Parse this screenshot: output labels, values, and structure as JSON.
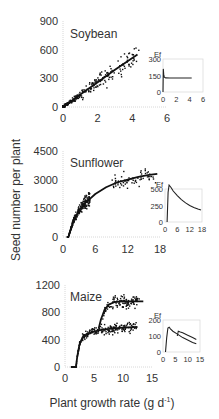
{
  "figure": {
    "ylabel": "Seed number per plant",
    "xlabel": "Plant growth rate (g d",
    "xlabel_sup": "-1",
    "xlabel_close": ")"
  },
  "chart_data": [
    {
      "type": "scatter",
      "title": "Soybean",
      "xlabel": "Plant growth rate (g d-1)",
      "ylabel": "Seed number per plant",
      "xlim": [
        0,
        6
      ],
      "ylim": [
        0,
        900
      ],
      "xticks": [
        0,
        2,
        4,
        6
      ],
      "yticks": [
        0,
        300,
        600,
        900
      ],
      "fit": {
        "type": "line",
        "x": [
          0,
          0.5,
          1,
          2,
          3,
          4.3
        ],
        "y": [
          0,
          65,
          130,
          260,
          390,
          550
        ]
      },
      "scatter_cloud": {
        "x_range": [
          0,
          4.5
        ],
        "y_range": [
          0,
          600
        ],
        "n": 260,
        "model": "linear",
        "slope": 128,
        "spread": 0.35
      },
      "inset": {
        "ylabel": "Ef",
        "xlim": [
          0,
          6
        ],
        "ylim": [
          0,
          300
        ],
        "xticks": [
          0,
          2,
          4,
          6
        ],
        "yticks": [
          0,
          150,
          300
        ],
        "series": [
          {
            "x": [
              0,
              0.05,
              0.1,
              0.2,
              0.4,
              1,
              2,
              3,
              4.3
            ],
            "y": [
              0,
              210,
              160,
              135,
              128,
              127,
              127,
              127,
              127
            ]
          }
        ]
      }
    },
    {
      "type": "scatter",
      "title": "Sunflower",
      "xlabel": "Plant growth rate (g d-1)",
      "ylabel": "Seed number per plant",
      "xlim": [
        0,
        18
      ],
      "ylim": [
        0,
        4500
      ],
      "xticks": [
        0,
        6,
        12,
        18
      ],
      "yticks": [
        0,
        1500,
        3000,
        4500
      ],
      "fit": {
        "type": "curve",
        "x": [
          1,
          2,
          3,
          4,
          5,
          6,
          8,
          10,
          12,
          14,
          16,
          17.5
        ],
        "y": [
          0,
          900,
          1400,
          1750,
          2000,
          2250,
          2600,
          2850,
          3000,
          3150,
          3250,
          3300
        ]
      },
      "scatter_cloud": {
        "x_range": [
          0.5,
          17.5
        ],
        "y_range": [
          0,
          4300
        ],
        "n": 280
      },
      "inset": {
        "ylabel": "Ef",
        "xlim": [
          0,
          18
        ],
        "ylim": [
          0,
          500
        ],
        "xticks": [
          0,
          6,
          12,
          18
        ],
        "yticks": [
          0,
          250,
          500
        ],
        "series": [
          {
            "x": [
              1,
              1.5,
              2,
              3,
              4,
              6,
              8,
              10,
              12,
              14,
              16,
              17.5
            ],
            "y": [
              0,
              450,
              560,
              520,
              470,
              400,
              340,
              290,
              250,
              220,
              195,
              180
            ]
          }
        ]
      }
    },
    {
      "type": "scatter",
      "title": "Maize",
      "xlabel": "Plant growth rate (g d-1)",
      "ylabel": "Seed number per plant",
      "xlim": [
        0,
        15
      ],
      "ylim": [
        0,
        1200
      ],
      "xticks": [
        0,
        5,
        10,
        15
      ],
      "yticks": [
        0,
        400,
        800,
        1200
      ],
      "fit": [
        {
          "name": "lower",
          "x": [
            1,
            1.9,
            2.1,
            2.5,
            3,
            4,
            5,
            6,
            8,
            10,
            12.5
          ],
          "y": [
            0,
            0,
            150,
            330,
            430,
            490,
            520,
            540,
            560,
            575,
            585
          ]
        },
        {
          "name": "upper",
          "x": [
            5.8,
            6.2,
            6.8,
            7.5,
            8.5,
            10,
            12,
            13.5
          ],
          "y": [
            560,
            700,
            830,
            910,
            950,
            960,
            960,
            960
          ]
        }
      ],
      "scatter_cloud": {
        "x_range": [
          1,
          13
        ],
        "y_range": [
          0,
          1150
        ],
        "n": 320
      },
      "inset": {
        "ylabel": "Ef",
        "xlim": [
          0,
          15
        ],
        "ylim": [
          0,
          200
        ],
        "xticks": [
          0,
          5,
          10,
          15
        ],
        "yticks": [
          0,
          100,
          200
        ],
        "series": [
          {
            "x": [
              1,
              1.5,
              2,
              2.5,
              3,
              4,
              6,
              8,
              10,
              12,
              13.5
            ],
            "y": [
              0,
              90,
              150,
              155,
              145,
              130,
              110,
              90,
              75,
              60,
              52
            ]
          },
          {
            "x": [
              5.8,
              6.2,
              7,
              8,
              10,
              12,
              13.5
            ],
            "y": [
              100,
              130,
              125,
              120,
              105,
              90,
              78
            ]
          }
        ]
      }
    }
  ]
}
